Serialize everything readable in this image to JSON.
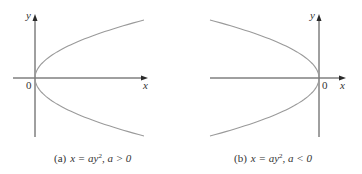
{
  "panels": [
    {
      "id": "a",
      "equation": "x = ay²",
      "condition": "a > 0",
      "caption_prefix": "(a)",
      "caption_eq": "x = ay",
      "caption_exp": "2",
      "caption_cond": ", a > 0",
      "opens": "right",
      "axis_labels": {
        "x": "x",
        "y": "y",
        "origin": "0"
      }
    },
    {
      "id": "b",
      "equation": "x = ay²",
      "condition": "a < 0",
      "caption_prefix": "(b)",
      "caption_eq": "x = ay",
      "caption_exp": "2",
      "caption_cond": ", a < 0",
      "opens": "left",
      "axis_labels": {
        "x": "x",
        "y": "y",
        "origin": "0"
      }
    }
  ],
  "colors": {
    "axis": "#2a2a2a",
    "curve": "#9a9a9a",
    "text": "#333333"
  }
}
